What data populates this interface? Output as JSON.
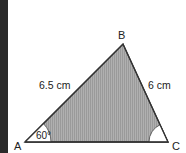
{
  "diagram": {
    "type": "triangle",
    "vertices": [
      {
        "name": "A",
        "label": "A"
      },
      {
        "name": "B",
        "label": "B"
      },
      {
        "name": "C",
        "label": "C"
      }
    ],
    "sides": {
      "AB": {
        "label": "6.5 cm"
      },
      "BC": {
        "label": "6 cm"
      }
    },
    "angles": {
      "A": {
        "label": "60°"
      },
      "C": {
        "label": ""
      }
    },
    "colors": {
      "fill": "#a8a8a8",
      "stroke": "#333333",
      "angle_fill": "#ffffff",
      "left_bar": "#2a2a2a"
    }
  }
}
